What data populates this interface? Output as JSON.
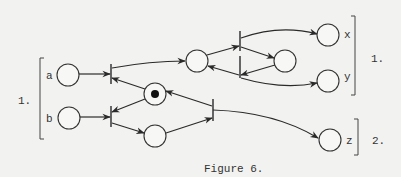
{
  "figure": {
    "caption": "Figure 6.",
    "group_labels": {
      "left_input": "1.",
      "right_output_1": "1.",
      "right_output_2": "2."
    },
    "places": [
      {
        "id": "a",
        "label": "a",
        "tokens": 0
      },
      {
        "id": "b",
        "label": "b",
        "tokens": 0
      },
      {
        "id": "mutex",
        "label": "",
        "tokens": 1
      },
      {
        "id": "p_bottom",
        "label": "",
        "tokens": 0
      },
      {
        "id": "p_left_mid",
        "label": "",
        "tokens": 0
      },
      {
        "id": "p_right_mid",
        "label": "",
        "tokens": 0
      },
      {
        "id": "x",
        "label": "x",
        "tokens": 0
      },
      {
        "id": "y",
        "label": "y",
        "tokens": 0
      },
      {
        "id": "z",
        "label": "z",
        "tokens": 0
      }
    ],
    "colors": {
      "background": "#f2f2f0",
      "ink": "#2a2a2a"
    }
  }
}
